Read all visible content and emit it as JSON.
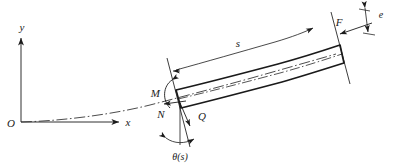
{
  "figure": {
    "type": "engineering-mechanics-diagram",
    "colors": {
      "stroke": "#1a1a1a",
      "thin_stroke": "#555555",
      "background": "#ffffff"
    },
    "axes": {
      "origin_label": "O",
      "x_label": "x",
      "y_label": "y"
    },
    "labels": {
      "moment": "M",
      "normal_force": "N",
      "shear_force": "Q",
      "applied_force": "F",
      "arc_length": "s",
      "eccentricity": "e",
      "angle": "θ(s)"
    },
    "annotations": {
      "centerline_style": "dash-dot",
      "beam_outline": "thick",
      "dimension_lines": [
        "s",
        "e"
      ],
      "force_arrows": [
        "M",
        "N",
        "Q",
        "F"
      ]
    }
  }
}
